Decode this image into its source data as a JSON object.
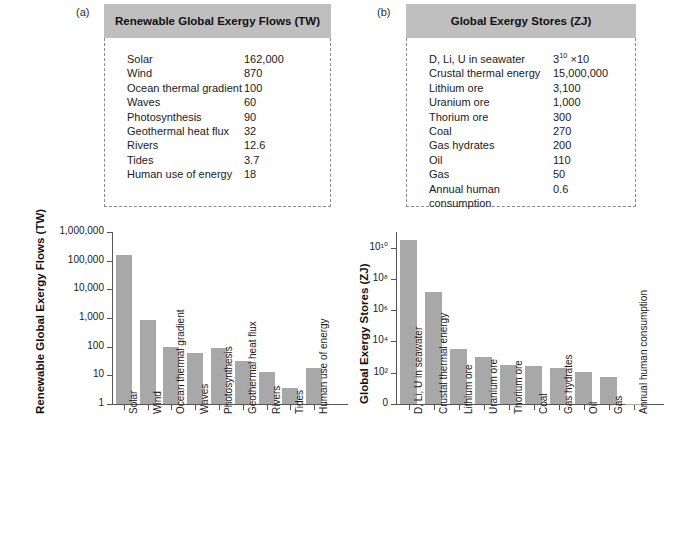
{
  "figure": {
    "panel_a_letter": "(a)",
    "panel_b_letter": "(b)"
  },
  "panel_a": {
    "title": "Renewable Global Exergy Flows (TW)",
    "rows": [
      {
        "name": "Solar",
        "value": "162,000"
      },
      {
        "name": "Wind",
        "value": "870"
      },
      {
        "name": "Ocean thermal gradient",
        "value": "100"
      },
      {
        "name": "Waves",
        "value": "60"
      },
      {
        "name": "Photosynthesis",
        "value": "90"
      },
      {
        "name": "Geothermal heat flux",
        "value": "32"
      },
      {
        "name": "Rivers",
        "value": "12.6"
      },
      {
        "name": "Tides",
        "value": "3.7"
      },
      {
        "name": "Human use of energy",
        "value": "18"
      }
    ]
  },
  "panel_b": {
    "title": "Global Exergy Stores (ZJ)",
    "rows": [
      {
        "name": "D, Li, U in seawater",
        "value": "3",
        "sup": "10",
        "suffix": " ×10"
      },
      {
        "name": "Crustal thermal energy",
        "value": "15,000,000",
        "sup": "",
        "suffix": ""
      },
      {
        "name": "Lithium ore",
        "value": "3,100",
        "sup": "",
        "suffix": ""
      },
      {
        "name": "Uranium ore",
        "value": "1,000",
        "sup": "",
        "suffix": ""
      },
      {
        "name": "Thorium ore",
        "value": "300",
        "sup": "",
        "suffix": ""
      },
      {
        "name": "Coal",
        "value": "270",
        "sup": "",
        "suffix": ""
      },
      {
        "name": "Gas hydrates",
        "value": "200",
        "sup": "",
        "suffix": ""
      },
      {
        "name": "Oil",
        "value": "110",
        "sup": "",
        "suffix": ""
      },
      {
        "name": "Gas",
        "value": "50",
        "sup": "",
        "suffix": ""
      },
      {
        "name": "Annual human consumption",
        "value": "0.6",
        "sup": "",
        "suffix": ""
      }
    ]
  },
  "chart_data": [
    {
      "type": "bar",
      "id": "chart-a",
      "title": "",
      "ylabel": "Renewable Global Exergy Flows (TW)",
      "xlabel": "",
      "yscale": "log",
      "ylim": [
        1,
        1000000
      ],
      "ytick_labels": [
        "1",
        "10",
        "100",
        "1,000",
        "10,000",
        "100,000",
        "1,000,000"
      ],
      "ytick_values": [
        1,
        10,
        100,
        1000,
        10000,
        100000,
        1000000
      ],
      "grid": false,
      "legend": "none",
      "bar_color": "#a8a8a8",
      "categories": [
        "Solar",
        "Wind",
        "Ocean thermal gradient",
        "Waves",
        "Photosynthesis",
        "Geothermal heat flux",
        "Rivers",
        "Tides",
        "Human use of energy"
      ],
      "values": [
        162000,
        870,
        100,
        60,
        90,
        32,
        12.6,
        3.7,
        18
      ]
    },
    {
      "type": "bar",
      "id": "chart-b",
      "title": "",
      "ylabel": "Global Exergy Stores (ZJ)",
      "xlabel": "",
      "yscale": "log",
      "ylim": [
        1,
        100000000000
      ],
      "ytick_labels": [
        "0",
        "10²",
        "10⁴",
        "10⁶",
        "10⁸",
        "10¹⁰"
      ],
      "ytick_values": [
        1,
        100,
        10000,
        1000000,
        100000000,
        10000000000
      ],
      "grid": false,
      "legend": "none",
      "bar_color": "#a8a8a8",
      "categories": [
        "D, Li, U in seawater",
        "Crustal thermal energy",
        "Lithium ore",
        "Uranium ore",
        "Thorium ore",
        "Coal",
        "Gas hydrates",
        "Oil",
        "Gas",
        "Annual human consumption"
      ],
      "values": [
        30000000000,
        15000000,
        3100,
        1000,
        300,
        270,
        200,
        110,
        50,
        0.6
      ]
    }
  ]
}
